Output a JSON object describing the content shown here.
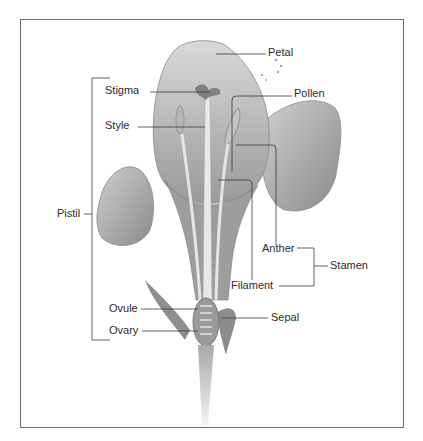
{
  "figure": {
    "type": "labeled flower cross-section illustration",
    "labels": {
      "petal": "Petal",
      "stigma": "Stigma",
      "pollen": "Pollen",
      "style": "Style",
      "pistil": "Pistil",
      "anther": "Anther",
      "stamen": "Stamen",
      "filament": "Filament",
      "ovule": "Ovule",
      "ovary": "Ovary",
      "sepal": "Sepal"
    },
    "groups": {
      "pistil_parts": [
        "Stigma",
        "Style",
        "Ovule",
        "Ovary"
      ],
      "stamen_parts": [
        "Anther",
        "Filament"
      ]
    },
    "colors": {
      "frame": "#6a6a6a",
      "leader_lines": "#3a3a3a",
      "label_text": "#2b2b2b"
    }
  }
}
